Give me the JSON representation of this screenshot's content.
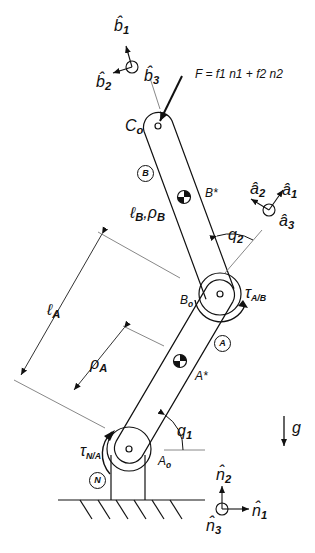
{
  "diagram": {
    "type": "two-link planar robot arm free-body schematic",
    "force": {
      "label": "F = f1 n1 + f2 n2",
      "vector": "F",
      "f1": "f1",
      "f2": "f2",
      "n1": "n1",
      "n2": "n2"
    },
    "bodies": [
      {
        "id": "N",
        "label": "N",
        "description": "ground / base"
      },
      {
        "id": "A",
        "label": "A",
        "description": "lower link"
      },
      {
        "id": "B",
        "label": "B",
        "description": "upper link"
      }
    ],
    "points": {
      "A_o": {
        "base": "A",
        "sub": "o"
      },
      "B_o": {
        "base": "B",
        "sub": "o"
      },
      "C_o": {
        "base": "C",
        "sub": "o"
      },
      "A_star": "A*",
      "B_star": "B*"
    },
    "lengths": {
      "l_A": {
        "base": "ℓ",
        "sub": "A"
      },
      "rho_A": {
        "base": "ρ",
        "sub": "A"
      },
      "l_B_rho_B": {
        "base1": "ℓ",
        "sub1": "B",
        "sep": ",",
        "base2": "ρ",
        "sub2": "B"
      }
    },
    "angles": {
      "q1": {
        "base": "q",
        "sub": "1"
      },
      "q2": {
        "base": "q",
        "sub": "2"
      }
    },
    "torques": {
      "tau_N_A": {
        "base": "τ",
        "sub": "N/A"
      },
      "tau_A_B": {
        "base": "τ",
        "sub": "A/B"
      }
    },
    "gravity": {
      "base": "g"
    },
    "frames": {
      "n": {
        "x": "n̂1",
        "y": "n̂2",
        "z": "n̂3",
        "x_base": "n̂",
        "x_sub": "1",
        "y_base": "n̂",
        "y_sub": "2",
        "z_base": "n̂",
        "z_sub": "3"
      },
      "a": {
        "x_base": "â",
        "x_sub": "1",
        "y_base": "â",
        "y_sub": "2",
        "z_base": "â",
        "z_sub": "3"
      },
      "b": {
        "x_base": "b̂",
        "x_sub": "1",
        "y_base": "b̂",
        "y_sub": "2",
        "z_base": "b̂",
        "z_sub": "3"
      }
    }
  }
}
